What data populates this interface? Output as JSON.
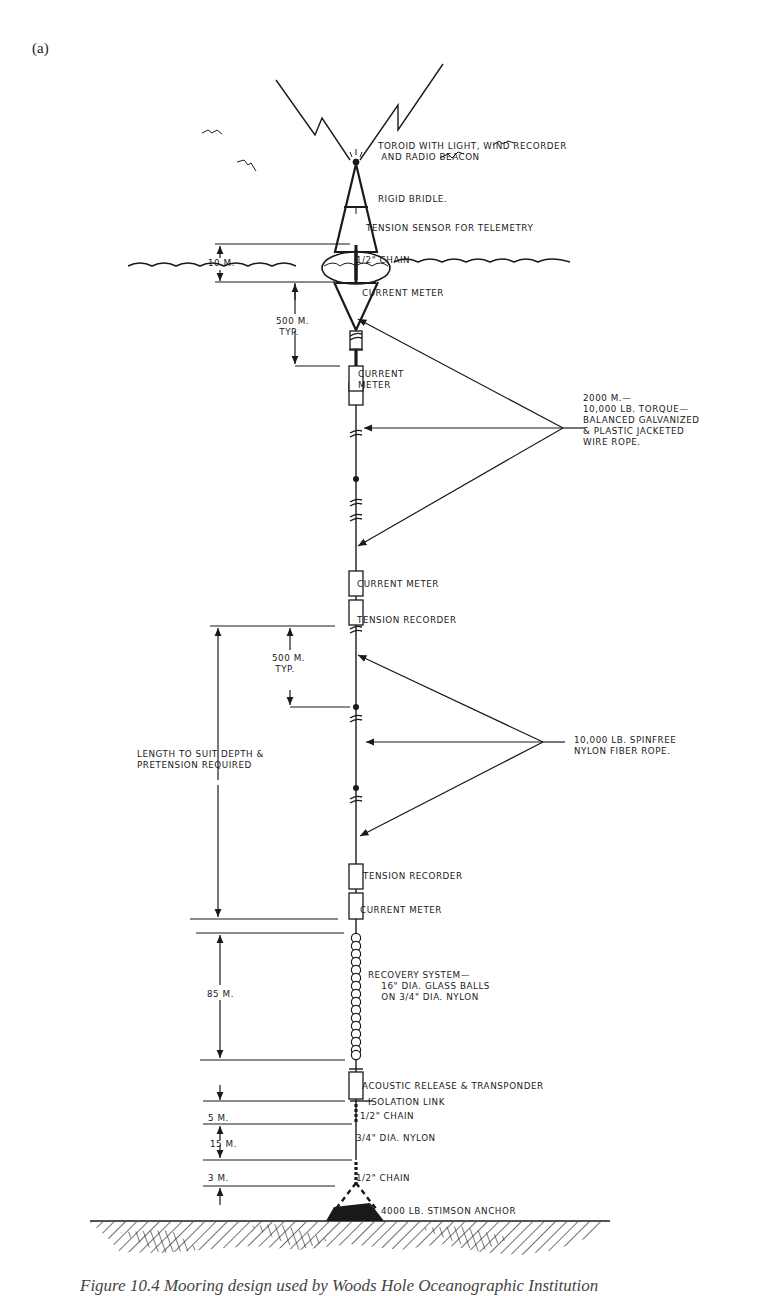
{
  "panel_label": "(a)",
  "caption": "Figure 10.4 Mooring design used by Woods Hole Oceanographic Institution",
  "labels": {
    "toroid": "TOROID WITH LIGHT, WIND RECORDER\n AND RADIO BEACON",
    "bridle": "RIGID BRIDLE.",
    "tension_sensor": "TENSION SENSOR FOR TELEMETRY",
    "chain_top": "1/2\" CHAIN",
    "current_meter_1": "CURRENT METER",
    "current_meter_2": "CURRENT\nMETER",
    "wire_rope": "2000 M.—\n10,000 LB. TORQUE—\nBALANCED GALVANIZED\n& PLASTIC JACKETED\nWIRE ROPE.",
    "current_meter_3": "CURRENT METER",
    "tension_recorder_1": "TENSION RECORDER",
    "nylon_rope": "10,000 LB. SPINFREE\nNYLON FIBER ROPE.",
    "length_note": "LENGTH TO SUIT DEPTH &\nPRETENSION REQUIRED",
    "tension_recorder_2": "TENSION RECORDER",
    "current_meter_4": "CURRENT METER",
    "recovery": "RECOVERY SYSTEM—\n    16\" DIA. GLASS BALLS\n    ON 3/4\" DIA. NYLON",
    "acoustic": "ACOUSTIC RELEASE & TRANSPONDER",
    "isolation": "ISOLATION LINK",
    "chain_lower": "1/2\" CHAIN",
    "nylon_lower": "3/4\" DIA. NYLON",
    "chain_bottom": "1/2\" CHAIN",
    "anchor": "4000 LB. STIMSON ANCHOR"
  },
  "dimensions": {
    "d10": "10 M.",
    "d500a": "500 M.\n TYP.",
    "d500b": "500 M.\n TYP.",
    "d85": "85 M.",
    "d5": "5 M.",
    "d15": "15 M.",
    "d3": "3 M."
  },
  "glass_ball_count": 16
}
